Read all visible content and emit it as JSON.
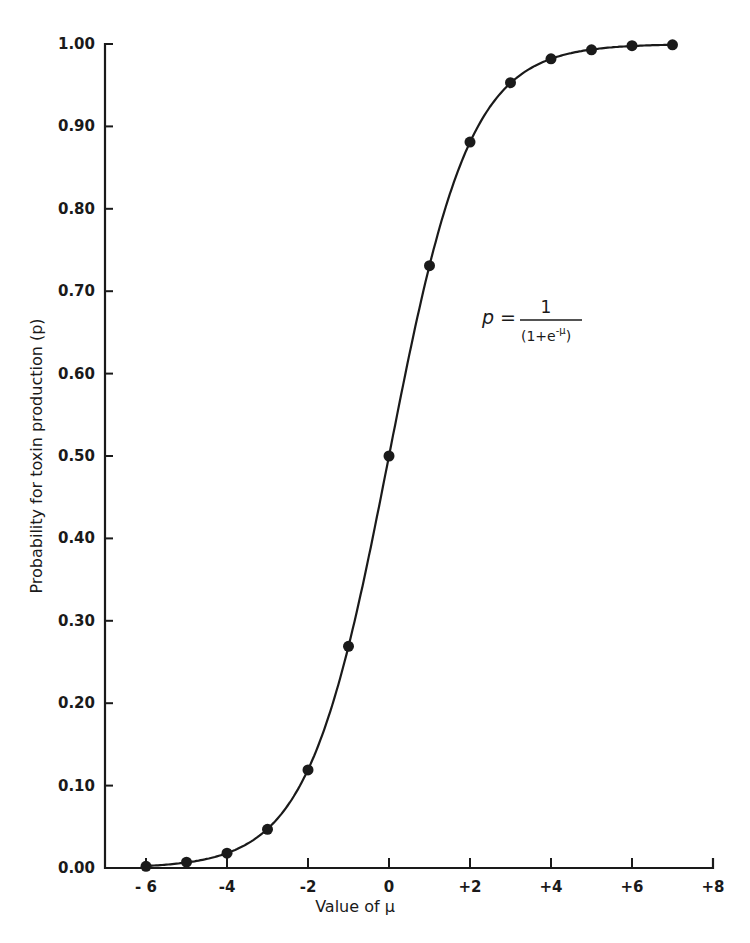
{
  "chart_data": {
    "type": "line",
    "title": "",
    "xlabel": "Value of μ",
    "ylabel": "Probability for toxin production (p)",
    "xlim": [
      -6.5,
      8
    ],
    "ylim": [
      0,
      1
    ],
    "x_ticks": [
      -6,
      -4,
      -2,
      0,
      2,
      4,
      6,
      8
    ],
    "x_tick_labels": [
      "- 6",
      "-4",
      "-2",
      "0",
      "+2",
      "+4",
      "+6",
      "+8"
    ],
    "y_ticks": [
      0,
      0.1,
      0.2,
      0.3,
      0.4,
      0.5,
      0.6,
      0.7,
      0.8,
      0.9,
      1.0
    ],
    "y_tick_labels": [
      "0.00",
      "0.10",
      "0.20",
      "0.30",
      "0.40",
      "0.50",
      "0.60",
      "0.70",
      "0.80",
      "0.90",
      "1.00"
    ],
    "grid": false,
    "legend": null,
    "annotation": {
      "lhs": "p =",
      "numerator": "1",
      "denominator": "(1+e",
      "exponent": "-μ",
      "denominator_close": ")"
    },
    "series": [
      {
        "name": "logistic curve p = 1/(1+e^-μ)",
        "style": "smooth line with filled circle markers",
        "x": [
          -6,
          -5,
          -4,
          -3,
          -2,
          -1,
          0,
          1,
          2,
          3,
          4,
          5,
          6,
          7
        ],
        "values": [
          0.002,
          0.007,
          0.018,
          0.047,
          0.119,
          0.269,
          0.5,
          0.731,
          0.881,
          0.953,
          0.982,
          0.993,
          0.998,
          0.999
        ]
      }
    ]
  }
}
